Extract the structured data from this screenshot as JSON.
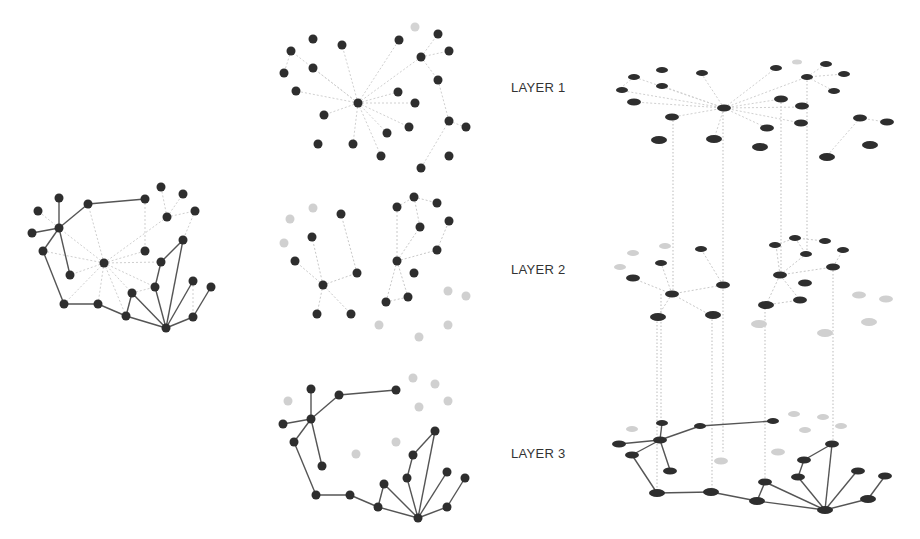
{
  "labels": {
    "layer1": "LAYER 1",
    "layer2": "LAYER 2",
    "layer3": "LAYER 3"
  },
  "colors": {
    "node": "#2e2e2e",
    "node_inactive": "#cfcfcf",
    "edge_solid": "#555555",
    "edge_dashed": "#c8c8c8",
    "interlayer": "#bbbbbb"
  },
  "panels": [
    "aggregated-network",
    "layer-decomposition",
    "multilayer-stack"
  ]
}
